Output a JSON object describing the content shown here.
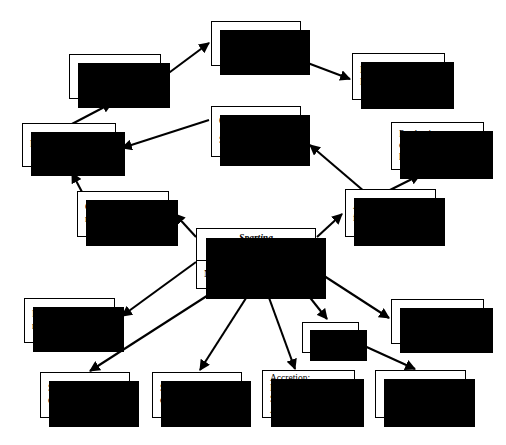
{
  "diagram": {
    "type": "flow-diagram",
    "background_color": "#ffffff",
    "box_fill": "#ffffff",
    "box_border_color": "#000000",
    "shadow_color": "#000000",
    "arrow_color": "#000000",
    "nodes": [
      {
        "id": "pen-padding",
        "label": "Pen Padding",
        "align": "center"
      },
      {
        "id": "methane",
        "label": "Methane",
        "align": "center"
      },
      {
        "id": "illumination",
        "label": "Illumination,\nFuel",
        "align": "left"
      },
      {
        "id": "farm-crops",
        "label": "Farm Crops",
        "align": "left"
      },
      {
        "id": "manure",
        "label": "Organic manure\n\nStable manure",
        "align": "left"
      },
      {
        "id": "production",
        "label": "Production\nof animal\nhusbandry",
        "align": "left"
      },
      {
        "id": "green-manure",
        "label": "Green\nmanure",
        "align": "left"
      },
      {
        "id": "animal-fodder",
        "label": "Animal\nfodder",
        "align": "left"
      },
      {
        "id": "spartina",
        "label_top": "Spartina\nanglica",
        "label_bottom": "N,P,S,  micronutrients",
        "align": "left"
      },
      {
        "id": "paper-making",
        "label": "Paper\nmaking",
        "align": "left"
      },
      {
        "id": "nereids",
        "label": "Nereids",
        "align": "center"
      },
      {
        "id": "fuel",
        "label": "Fuel",
        "align": "center"
      },
      {
        "id": "siltation",
        "label": "Siltation\ncontrol",
        "align": "left"
      },
      {
        "id": "stabilization",
        "label": "Stabilization\nof coastline",
        "align": "left"
      },
      {
        "id": "accretion",
        "label": "Accretion;\nReclamation;\nSaline Soil\nAmelioration",
        "align": "left"
      },
      {
        "id": "fish",
        "label": "Fish",
        "align": "center"
      }
    ],
    "edges": [
      {
        "from": "pen-padding",
        "to": "methane"
      },
      {
        "from": "methane",
        "to": "illumination"
      },
      {
        "from": "farm-crops",
        "to": "pen-padding"
      },
      {
        "from": "manure",
        "to": "farm-crops"
      },
      {
        "from": "green-manure",
        "to": "farm-crops"
      },
      {
        "from": "animal-fodder",
        "to": "manure"
      },
      {
        "from": "animal-fodder",
        "to": "production"
      },
      {
        "from": "spartina",
        "to": "green-manure"
      },
      {
        "from": "spartina",
        "to": "animal-fodder"
      },
      {
        "from": "spartina",
        "to": "paper-making"
      },
      {
        "from": "spartina",
        "to": "siltation"
      },
      {
        "from": "spartina",
        "to": "stabilization"
      },
      {
        "from": "spartina",
        "to": "accretion"
      },
      {
        "from": "spartina",
        "to": "nereids"
      },
      {
        "from": "spartina",
        "to": "fuel"
      },
      {
        "from": "nereids",
        "to": "fish"
      }
    ]
  }
}
